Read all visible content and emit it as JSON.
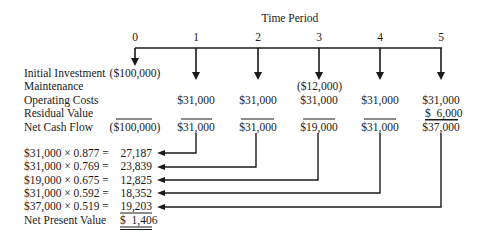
{
  "header": {
    "title": "Time Period"
  },
  "periods": [
    "0",
    "1",
    "2",
    "3",
    "4",
    "5"
  ],
  "row_labels": {
    "initial_investment": "Initial Investment",
    "maintenance": "Maintenance",
    "operating_costs": "Operating Costs",
    "residual_value": "Residual Value",
    "net_cash_flow": "Net Cash Flow"
  },
  "cells": {
    "initial_investment": {
      "p0": "($100,000)"
    },
    "maintenance": {
      "p3": "($12,000)"
    },
    "operating_costs": {
      "p1": "$31,000",
      "p2": "$31,000",
      "p3": "$31,000",
      "p4": "$31,000",
      "p5": "$31,000"
    },
    "residual_value": {
      "p5": "$  6,000"
    },
    "net_cash_flow": {
      "p0": "($100,000)",
      "p1": "$31,000",
      "p2": "$31,000",
      "p3": "$19,000",
      "p4": "$31,000",
      "p5": "$37,000"
    }
  },
  "calculations": [
    {
      "formula": "$31,000 × 0.877 =",
      "value": "27,187",
      "period": "1"
    },
    {
      "formula": "$31,000 × 0.769 =",
      "value": "23,839",
      "period": "2"
    },
    {
      "formula": "$19,000 × 0.675 =",
      "value": "12,825",
      "period": "3"
    },
    {
      "formula": "$31,000 × 0.592 =",
      "value": "18,352",
      "period": "4"
    },
    {
      "formula": "$37,000 × 0.519 =",
      "value": "19,203",
      "period": "5"
    }
  ],
  "npv": {
    "label": "Net Present Value",
    "value": "$  1,406"
  }
}
